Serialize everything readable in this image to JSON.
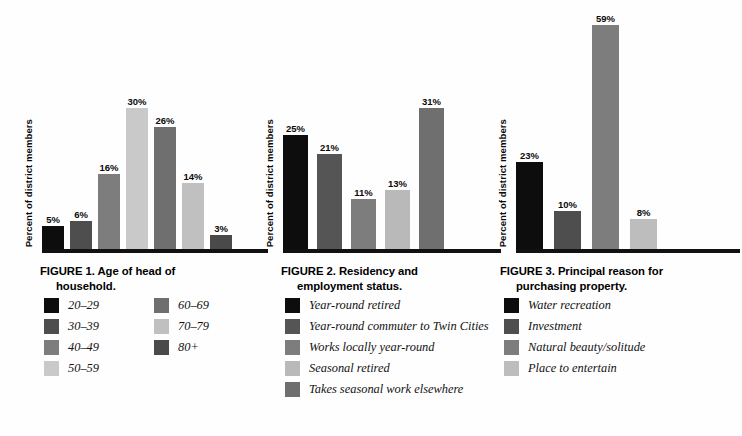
{
  "page": {
    "background": "#fefefe",
    "ylabel": "Percent of district members"
  },
  "palette": {
    "black": "#0d0d0d",
    "dark_gray": "#4e4e4e",
    "mid_gray": "#7d7d7d",
    "light_gray": "#b9b9b9",
    "pale_gray": "#c9c9c9",
    "baseline": "#111111"
  },
  "figures": [
    {
      "id": "figure-1",
      "caption_line1": "FIGURE 1.  Age of head of",
      "caption_line2": "household.",
      "ylabel": "Percent of district members",
      "legend_columns": 2,
      "chart_data": {
        "type": "bar",
        "title": "FIGURE 1.  Age of head of household.",
        "xlabel": "",
        "ylabel": "Percent of district members",
        "ylim": [
          0,
          32
        ],
        "grid": false,
        "legend_position": "below",
        "categories": [
          "20–29",
          "30–39",
          "40–49",
          "50–59",
          "60–69",
          "70–79",
          "80+"
        ],
        "values": [
          5,
          6,
          16,
          30,
          26,
          14,
          3
        ],
        "value_labels": [
          "5%",
          "6%",
          "16%",
          "30%",
          "26%",
          "14%",
          "3%"
        ],
        "colors": [
          "#0d0d0d",
          "#4e4e4e",
          "#7d7d7d",
          "#c9c9c9",
          "#6f6f6f",
          "#c0c0c0",
          "#4a4a4a"
        ]
      },
      "legend": [
        {
          "label": "20–29",
          "color": "#0d0d0d"
        },
        {
          "label": "30–39",
          "color": "#4e4e4e"
        },
        {
          "label": "40–49",
          "color": "#7d7d7d"
        },
        {
          "label": "50–59",
          "color": "#c9c9c9"
        },
        {
          "label": "60–69",
          "color": "#6f6f6f"
        },
        {
          "label": "70–79",
          "color": "#c0c0c0"
        },
        {
          "label": "80+",
          "color": "#4a4a4a"
        }
      ]
    },
    {
      "id": "figure-2",
      "caption_line1": "FIGURE 2.  Residency and",
      "caption_line2": "employment status.",
      "ylabel": "Percent of district members",
      "legend_columns": 1,
      "chart_data": {
        "type": "bar",
        "title": "FIGURE 2.  Residency and employment status.",
        "xlabel": "",
        "ylabel": "Percent of district members",
        "ylim": [
          0,
          33
        ],
        "grid": false,
        "legend_position": "below",
        "categories": [
          "Year-round retired",
          "Year-round commuter to Twin Cities",
          "Works locally year-round",
          "Seasonal retired",
          "Takes seasonal work elsewhere"
        ],
        "values": [
          25,
          21,
          11,
          13,
          31
        ],
        "value_labels": [
          "25%",
          "21%",
          "11%",
          "13%",
          "31%"
        ],
        "colors": [
          "#0d0d0d",
          "#555555",
          "#7d7d7d",
          "#b9b9b9",
          "#6f6f6f"
        ]
      },
      "legend": [
        {
          "label": "Year-round retired",
          "color": "#0d0d0d"
        },
        {
          "label": "Year-round commuter to Twin Cities",
          "color": "#555555"
        },
        {
          "label": "Works locally year-round",
          "color": "#7d7d7d"
        },
        {
          "label": "Seasonal retired",
          "color": "#b9b9b9"
        },
        {
          "label": "Takes seasonal work elsewhere",
          "color": "#6f6f6f"
        }
      ]
    },
    {
      "id": "figure-3",
      "caption_line1": "FIGURE 3.  Principal reason for",
      "caption_line2": "purchasing property.",
      "ylabel": "Percent of district members",
      "legend_columns": 1,
      "chart_data": {
        "type": "bar",
        "title": "FIGURE 3.  Principal reason for purchasing property.",
        "xlabel": "",
        "ylabel": "Percent of district members",
        "ylim": [
          0,
          62
        ],
        "grid": false,
        "legend_position": "below",
        "categories": [
          "Water recreation",
          "Investment",
          "Natural beauty/solitude",
          "Place to entertain"
        ],
        "values": [
          23,
          10,
          59,
          8
        ],
        "value_labels": [
          "23%",
          "10%",
          "59%",
          "8%"
        ],
        "colors": [
          "#0d0d0d",
          "#4e4e4e",
          "#7d7d7d",
          "#bdbdbd"
        ]
      },
      "legend": [
        {
          "label": "Water recreation",
          "color": "#0d0d0d"
        },
        {
          "label": "Investment",
          "color": "#4e4e4e"
        },
        {
          "label": "Natural beauty/solitude",
          "color": "#7d7d7d"
        },
        {
          "label": "Place to entertain",
          "color": "#bdbdbd"
        }
      ]
    }
  ]
}
